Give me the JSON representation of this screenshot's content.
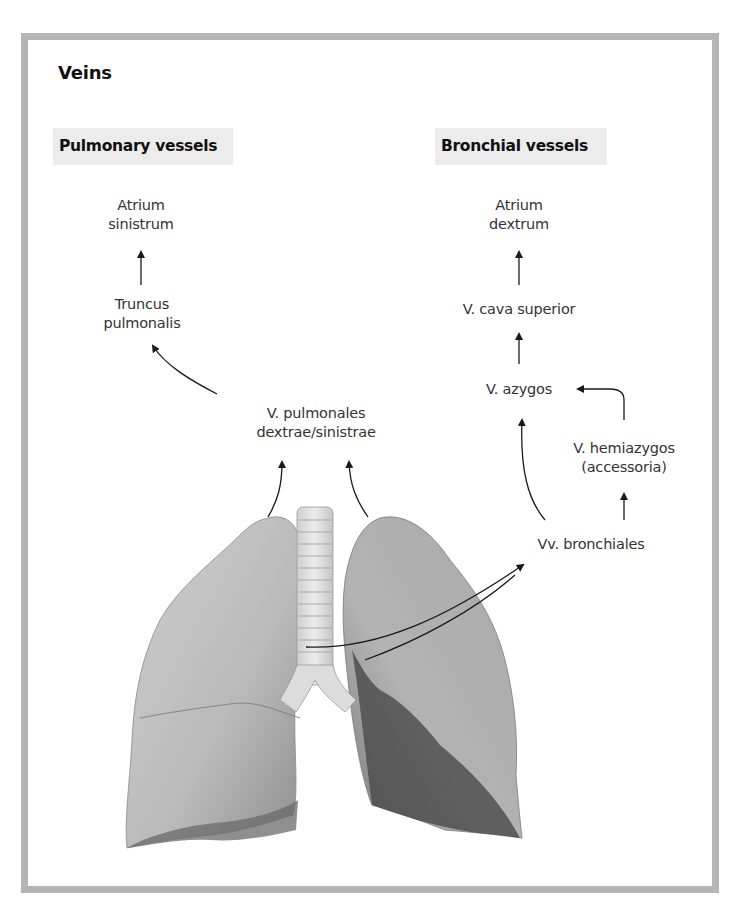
{
  "figure": {
    "title": "Veins",
    "colors": {
      "frame": "#b5b5b5",
      "section_header_bg": "#ececec",
      "text": "#333333",
      "arrow": "#1a1a1a",
      "lung": "#bdbdbd",
      "lung_shadow": "#5a5a5a"
    }
  },
  "pulmonary": {
    "header": "Pulmonary vessels",
    "nodes": {
      "atrium_sinistrum": [
        "Atrium",
        "sinistrum"
      ],
      "truncus_pulmonalis": [
        "Truncus",
        "pulmonalis"
      ],
      "v_pulmonales": [
        "V. pulmonales",
        "dextrae/sinistrae"
      ]
    }
  },
  "bronchial": {
    "header": "Bronchial vessels",
    "nodes": {
      "atrium_dextrum": [
        "Atrium",
        "dextrum"
      ],
      "v_cava_superior": "V. cava superior",
      "v_azygos": "V. azygos",
      "v_hemiazygos": [
        "V. hemiazygos",
        "(accessoria)"
      ],
      "vv_bronchiales": "Vv. bronchiales"
    }
  },
  "illustration": {
    "subject": "lungs-with-trachea-anterior-view"
  }
}
